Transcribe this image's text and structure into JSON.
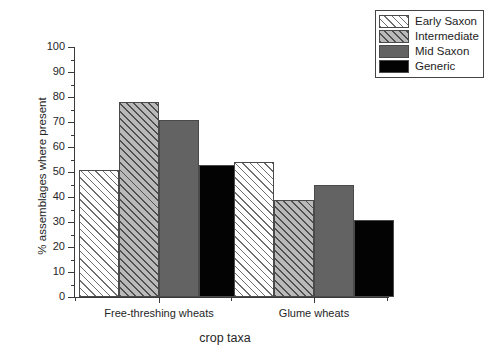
{
  "chart_data": {
    "type": "bar",
    "title": "",
    "xlabel": "crop taxa",
    "ylabel": "% assemblages where present",
    "categories": [
      "Free-threshing wheats",
      "Glume wheats"
    ],
    "series": [
      {
        "name": "Early Saxon",
        "values": [
          51,
          54
        ],
        "fill": "hatch-light",
        "color": "#ffffff"
      },
      {
        "name": "Intermediate",
        "values": [
          78,
          39
        ],
        "fill": "hatch-dark",
        "color": "#b9b9b9"
      },
      {
        "name": "Mid Saxon",
        "values": [
          71,
          45
        ],
        "fill": "solid-gray",
        "color": "#636363"
      },
      {
        "name": "Generic",
        "values": [
          53,
          31
        ],
        "fill": "solid-black",
        "color": "#030303"
      }
    ],
    "ylim": [
      0,
      100
    ],
    "ytick_step": 10,
    "yticks": [
      0,
      10,
      20,
      30,
      40,
      50,
      60,
      70,
      80,
      90,
      100
    ],
    "ytick_labels": [
      "0",
      "10",
      "20",
      "30",
      "40",
      "50",
      "60",
      "70",
      "80",
      "90",
      "100"
    ],
    "grid": false,
    "legend_position": "top-right",
    "legend_entries": [
      "Early Saxon",
      "Intermediate",
      "Mid Saxon",
      "Generic"
    ]
  }
}
